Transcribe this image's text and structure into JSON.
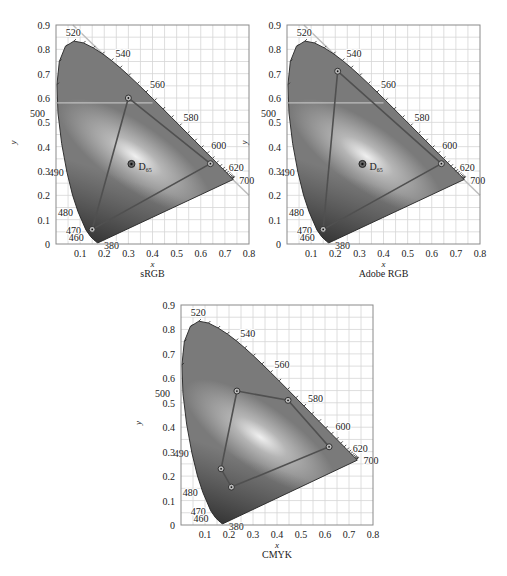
{
  "chart_data": [
    {
      "type": "scatter",
      "title": "sRGB",
      "xlabel": "x",
      "ylabel": "y",
      "xlim": [
        0,
        0.8
      ],
      "ylim": [
        0,
        0.9
      ],
      "xticks": [
        "0.1",
        "0.2",
        "0.3",
        "0.4",
        "0.5",
        "0.6",
        "0.7",
        "0.8"
      ],
      "yticks": [
        "0",
        "0.1",
        "0.2",
        "0.3",
        "0.4",
        "0.5",
        "0.6",
        "0.7",
        "0.8",
        "0.9"
      ],
      "grid": true,
      "gamut": [
        [
          0.64,
          0.33
        ],
        [
          0.3,
          0.6
        ],
        [
          0.15,
          0.06
        ]
      ],
      "white_point": {
        "label": "D65",
        "x": 0.3127,
        "y": 0.329
      },
      "frame": {
        "left": 56,
        "top": 25,
        "right": 249,
        "bottom": 244
      }
    },
    {
      "type": "scatter",
      "title": "Adobe RGB",
      "xlabel": "x",
      "ylabel": "y",
      "xlim": [
        0,
        0.8
      ],
      "ylim": [
        0,
        0.9
      ],
      "xticks": [
        "0.1",
        "0.2",
        "0.3",
        "0.4",
        "0.5",
        "0.6",
        "0.7",
        "0.8"
      ],
      "yticks": [
        "0",
        "0.1",
        "0.2",
        "0.3",
        "0.4",
        "0.5",
        "0.6",
        "0.7",
        "0.8",
        "0.9"
      ],
      "grid": true,
      "gamut": [
        [
          0.64,
          0.33
        ],
        [
          0.21,
          0.71
        ],
        [
          0.15,
          0.06
        ]
      ],
      "white_point": {
        "label": "D65",
        "x": 0.3127,
        "y": 0.329
      },
      "frame": {
        "left": 287,
        "top": 25,
        "right": 480,
        "bottom": 244
      }
    },
    {
      "type": "scatter",
      "title": "CMYK",
      "xlabel": "x",
      "ylabel": "y",
      "xlim": [
        0,
        0.8
      ],
      "ylim": [
        0,
        0.9
      ],
      "xticks": [
        "0.1",
        "0.2",
        "0.3",
        "0.4",
        "0.5",
        "0.6",
        "0.7",
        "0.8"
      ],
      "yticks": [
        "0",
        "0.1",
        "0.2",
        "0.3",
        "0.4",
        "0.5",
        "0.6",
        "0.7",
        "0.8",
        "0.9"
      ],
      "grid": true,
      "gamut": [
        [
          0.233,
          0.548
        ],
        [
          0.446,
          0.51
        ],
        [
          0.617,
          0.32
        ],
        [
          0.21,
          0.155
        ],
        [
          0.167,
          0.23
        ]
      ],
      "white_point": null,
      "frame": {
        "left": 181,
        "top": 305,
        "right": 373,
        "bottom": 525
      }
    }
  ],
  "spectral_locus_labels": [
    {
      "nm": "520",
      "x": 0.074,
      "y": 0.834
    },
    {
      "nm": "540",
      "x": 0.23,
      "y": 0.754
    },
    {
      "nm": "560",
      "x": 0.373,
      "y": 0.624
    },
    {
      "nm": "580",
      "x": 0.512,
      "y": 0.487
    },
    {
      "nm": "600",
      "x": 0.627,
      "y": 0.373
    },
    {
      "nm": "620",
      "x": 0.691,
      "y": 0.308
    },
    {
      "nm": "700",
      "x": 0.735,
      "y": 0.265
    },
    {
      "nm": "500",
      "x": 0.008,
      "y": 0.538
    },
    {
      "nm": "490",
      "x": 0.045,
      "y": 0.295
    },
    {
      "nm": "480",
      "x": 0.091,
      "y": 0.133
    },
    {
      "nm": "470",
      "x": 0.124,
      "y": 0.058
    },
    {
      "nm": "460",
      "x": 0.144,
      "y": 0.03
    },
    {
      "nm": "380",
      "x": 0.174,
      "y": 0.005
    }
  ],
  "locus": [
    [
      0.1741,
      0.005
    ],
    [
      0.1738,
      0.0049
    ],
    [
      0.1736,
      0.0049
    ],
    [
      0.1733,
      0.0048
    ],
    [
      0.1726,
      0.0048
    ],
    [
      0.1714,
      0.0051
    ],
    [
      0.1689,
      0.0069
    ],
    [
      0.1644,
      0.0109
    ],
    [
      0.1566,
      0.0177
    ],
    [
      0.144,
      0.0297
    ],
    [
      0.1241,
      0.0578
    ],
    [
      0.0913,
      0.1327
    ],
    [
      0.0687,
      0.2007
    ],
    [
      0.0454,
      0.295
    ],
    [
      0.0235,
      0.4127
    ],
    [
      0.0082,
      0.5384
    ],
    [
      0.0039,
      0.6548
    ],
    [
      0.0139,
      0.7502
    ],
    [
      0.0389,
      0.812
    ],
    [
      0.0743,
      0.8338
    ],
    [
      0.1142,
      0.8262
    ],
    [
      0.1547,
      0.8059
    ],
    [
      0.1929,
      0.7816
    ],
    [
      0.2296,
      0.7543
    ],
    [
      0.2658,
      0.7243
    ],
    [
      0.3016,
      0.6923
    ],
    [
      0.3373,
      0.6589
    ],
    [
      0.3731,
      0.6245
    ],
    [
      0.4087,
      0.5896
    ],
    [
      0.4441,
      0.5547
    ],
    [
      0.4788,
      0.5202
    ],
    [
      0.5125,
      0.4866
    ],
    [
      0.5448,
      0.4544
    ],
    [
      0.5752,
      0.4242
    ],
    [
      0.6029,
      0.3965
    ],
    [
      0.627,
      0.3725
    ],
    [
      0.6482,
      0.3514
    ],
    [
      0.6658,
      0.334
    ],
    [
      0.6801,
      0.3197
    ],
    [
      0.6915,
      0.3083
    ],
    [
      0.7006,
      0.2993
    ],
    [
      0.7079,
      0.292
    ],
    [
      0.714,
      0.2859
    ],
    [
      0.719,
      0.2809
    ],
    [
      0.723,
      0.277
    ],
    [
      0.726,
      0.274
    ],
    [
      0.7283,
      0.2717
    ],
    [
      0.73,
      0.27
    ],
    [
      0.7311,
      0.2689
    ],
    [
      0.732,
      0.268
    ],
    [
      0.7327,
      0.2673
    ],
    [
      0.7334,
      0.2666
    ],
    [
      0.734,
      0.266
    ],
    [
      0.7344,
      0.2656
    ],
    [
      0.7346,
      0.2654
    ],
    [
      0.7347,
      0.2653
    ]
  ],
  "captions": {
    "x_axis": "x",
    "y_axis": "y"
  },
  "colors": {
    "locus_fill_dark": "#3a3a3a",
    "locus_fill": "#7a7a7a",
    "highlight": "#f0f0f0",
    "gamut_line": "#505050",
    "grid": "#d6d6d6",
    "frame": "#8a8a8a"
  }
}
